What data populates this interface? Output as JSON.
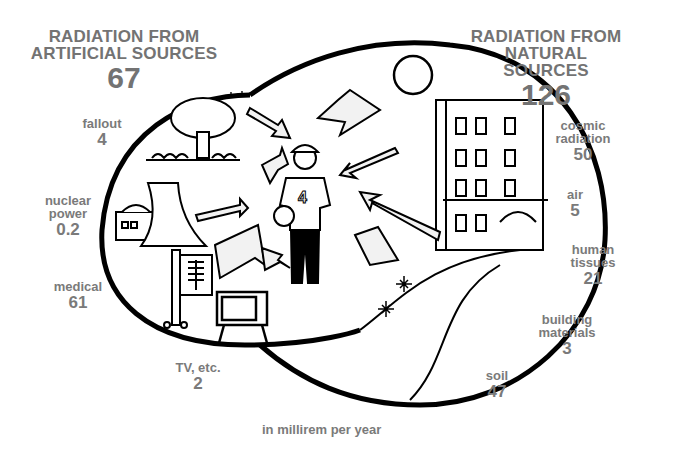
{
  "artificial": {
    "title_line1": "RADIATION FROM",
    "title_line2": "ARTIFICIAL SOURCES",
    "total": "67",
    "sources": [
      {
        "label": "fallout",
        "value": "4"
      },
      {
        "label": "nuclear power",
        "label_line1": "nuclear",
        "label_line2": "power",
        "value": "0.2"
      },
      {
        "label": "medical",
        "value": "61"
      },
      {
        "label": "TV, etc.",
        "value": "2"
      }
    ]
  },
  "natural": {
    "title_line1": "RADIATION FROM",
    "title_line2": "NATURAL SOURCES",
    "total": "126",
    "sources": [
      {
        "label": "cosmic radiation",
        "label_line1": "cosmic",
        "label_line2": "radiation",
        "value": "50"
      },
      {
        "label": "air",
        "value": "5"
      },
      {
        "label": "human tissues",
        "label_line1": "human",
        "label_line2": "tissues",
        "value": "21"
      },
      {
        "label": "building materials",
        "label_line1": "building",
        "label_line2": "materials",
        "value": "3"
      },
      {
        "label": "soil",
        "value": "47"
      }
    ]
  },
  "units": "in millirem per year",
  "colors": {
    "text": "#7a7a7a",
    "outline": "#000000",
    "background": "#ffffff"
  }
}
